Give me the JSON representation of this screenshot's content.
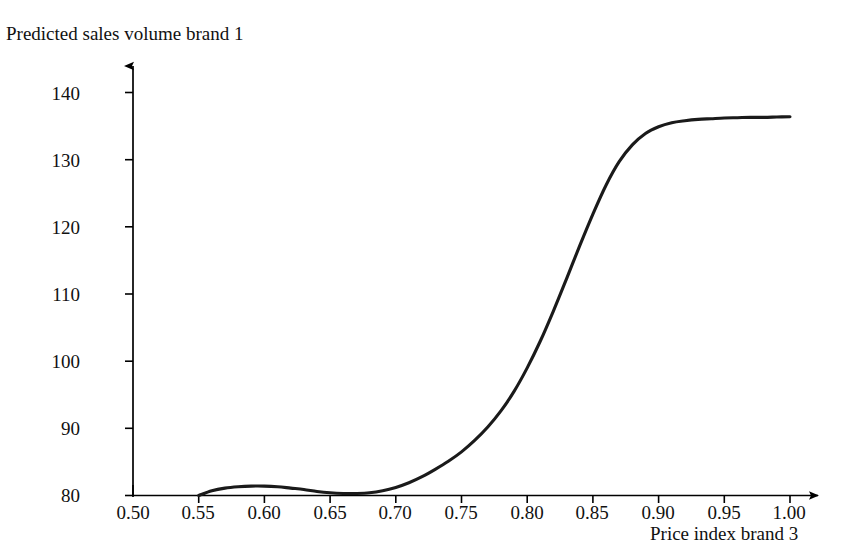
{
  "chart_data": {
    "type": "line",
    "title": "Predicted sales volume brand 1",
    "xlabel": "Price index brand 3",
    "ylabel": "Predicted sales volume brand 1",
    "grid": false,
    "legend": null,
    "xlim": [
      0.5,
      1.0
    ],
    "ylim": [
      80,
      140
    ],
    "xticks": [
      "0.50",
      "0.55",
      "0.60",
      "0.65",
      "0.70",
      "0.75",
      "0.80",
      "0.85",
      "0.90",
      "0.95",
      "1.00"
    ],
    "yticks": [
      "80",
      "90",
      "100",
      "110",
      "120",
      "130",
      "140"
    ],
    "line_color": "#1a1a1a",
    "axis_color": "#000000",
    "series": [
      {
        "name": "Predicted sales volume brand 1",
        "x": [
          0.55,
          0.56,
          0.57,
          0.58,
          0.59,
          0.6,
          0.61,
          0.62,
          0.63,
          0.64,
          0.65,
          0.66,
          0.67,
          0.68,
          0.69,
          0.7,
          0.71,
          0.72,
          0.73,
          0.74,
          0.75,
          0.76,
          0.77,
          0.78,
          0.79,
          0.8,
          0.81,
          0.82,
          0.83,
          0.84,
          0.85,
          0.86,
          0.87,
          0.88,
          0.89,
          0.9,
          0.91,
          0.92,
          0.93,
          0.94,
          0.95,
          0.96,
          0.97,
          0.98,
          0.99,
          1.0
        ],
        "y": [
          80.0,
          80.7,
          81.1,
          81.3,
          81.4,
          81.4,
          81.3,
          81.1,
          80.9,
          80.6,
          80.4,
          80.3,
          80.3,
          80.4,
          80.7,
          81.2,
          81.9,
          82.8,
          83.9,
          85.1,
          86.5,
          88.2,
          90.2,
          92.6,
          95.5,
          99.0,
          103.0,
          107.5,
          112.3,
          117.2,
          121.9,
          126.2,
          129.7,
          132.2,
          133.9,
          134.9,
          135.5,
          135.8,
          136.0,
          136.1,
          136.2,
          136.25,
          136.3,
          136.3,
          136.35,
          136.4
        ]
      }
    ],
    "annotations": [
      {
        "name": "local-maximum",
        "x": 0.595,
        "y": 81.4
      },
      {
        "name": "local-minimum",
        "x": 0.665,
        "y": 80.3
      },
      {
        "name": "inflection-point",
        "x": 0.835,
        "y": 114.8
      },
      {
        "name": "curve-end",
        "x": 1.0,
        "y": 136.4
      }
    ]
  }
}
